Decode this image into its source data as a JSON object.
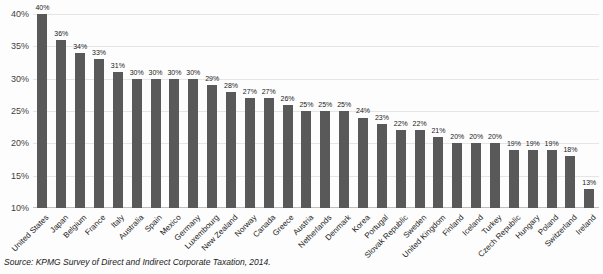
{
  "chart_data": {
    "type": "bar",
    "title": "",
    "xlabel": "",
    "ylabel": "",
    "categories": [
      "United States",
      "Japan",
      "Belgium",
      "France",
      "Italy",
      "Australia",
      "Spain",
      "Mexico",
      "Germany",
      "Luxembourg",
      "New Zealand",
      "Norway",
      "Canada",
      "Greece",
      "Austria",
      "Netherlands",
      "Denmark",
      "Korea",
      "Portugal",
      "Slovak Republic",
      "Sweden",
      "United Kingdom",
      "Finland",
      "Iceland",
      "Turkey",
      "Czech Republic",
      "Hungary",
      "Poland",
      "Switzerland",
      "Ireland"
    ],
    "values": [
      40,
      36,
      34,
      33,
      31,
      30,
      30,
      30,
      30,
      29,
      28,
      27,
      27,
      26,
      25,
      25,
      25,
      24,
      23,
      22,
      22,
      21,
      20,
      20,
      20,
      19,
      19,
      19,
      18,
      13
    ],
    "value_labels": [
      "40%",
      "36%",
      "34%",
      "33%",
      "31%",
      "30%",
      "30%",
      "30%",
      "30%",
      "29%",
      "28%",
      "27%",
      "27%",
      "26%",
      "25%",
      "25%",
      "25%",
      "24%",
      "23%",
      "22%",
      "22%",
      "21%",
      "20%",
      "20%",
      "20%",
      "19%",
      "19%",
      "19%",
      "18%",
      "13%"
    ],
    "ylim": [
      10,
      40
    ],
    "yticks": [
      40,
      35,
      30,
      25,
      20,
      15,
      10
    ],
    "ytick_labels": [
      "40%",
      "35%",
      "30%",
      "25%",
      "20%",
      "15%",
      "10%"
    ],
    "grid": "horizontal",
    "legend": "none",
    "bar_color": "#595959",
    "grid_color": "#e5e5e5",
    "baseline_color": "#bfbfbf"
  },
  "source_note": "Source: KPMG Survey of Direct and Indirect Corporate Taxation, 2014."
}
